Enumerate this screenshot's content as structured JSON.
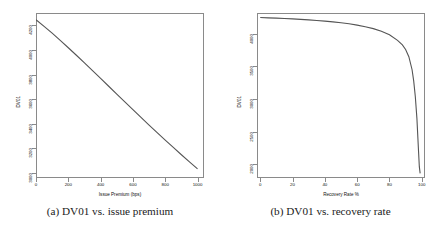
{
  "figure": {
    "panels": [
      {
        "id": "panel-a",
        "caption": "(a) DV01 vs. issue premium",
        "xlabel": "Issue Premium (bps)",
        "ylabel": "DV01"
      },
      {
        "id": "panel-b",
        "caption": "(b) DV01 vs. recovery rate",
        "xlabel": "Recovery Rate %",
        "ylabel": "DV01"
      }
    ]
  },
  "chart_data": [
    {
      "type": "line",
      "title": "",
      "caption": "(a) DV01 vs. issue premium",
      "xlabel": "Issue Premium (bps)",
      "ylabel": "DV01",
      "xlim": [
        0,
        1040
      ],
      "ylim": [
        2960,
        4300
      ],
      "xticks": [
        0,
        200,
        400,
        600,
        800,
        1000
      ],
      "xtick_labels": [
        "0",
        "200",
        "400",
        "600",
        "800",
        "1000"
      ],
      "yticks": [
        3000,
        3200,
        3400,
        3600,
        3800,
        4000,
        4200
      ],
      "ytick_labels": [
        "3000",
        "3200",
        "3400",
        "3600",
        "3800",
        "4000",
        "4200"
      ],
      "grid": false,
      "legend": null,
      "line_color": "#555555",
      "x": [
        0,
        50,
        100,
        150,
        200,
        250,
        300,
        350,
        400,
        450,
        500,
        550,
        600,
        650,
        700,
        750,
        800,
        850,
        900,
        950,
        1000
      ],
      "y": [
        4245,
        4192,
        4136,
        4078,
        4018,
        3957,
        3895,
        3832,
        3769,
        3705,
        3641,
        3578,
        3515,
        3452,
        3390,
        3329,
        3268,
        3208,
        3149,
        3091,
        3034
      ]
    },
    {
      "type": "line",
      "title": "",
      "caption": "(b) DV01 vs. recovery rate",
      "xlabel": "Recovery Rate %",
      "ylabel": "DV01",
      "xlim": [
        -2,
        102
      ],
      "ylim": [
        1790,
        4320
      ],
      "xticks": [
        0,
        20,
        40,
        60,
        80,
        100
      ],
      "xtick_labels": [
        "0",
        "20",
        "40",
        "60",
        "80",
        "100"
      ],
      "yticks": [
        2000,
        2500,
        3000,
        3500,
        4000
      ],
      "ytick_labels": [
        "2000",
        "2500",
        "3000",
        "3500",
        "4000"
      ],
      "grid": false,
      "legend": null,
      "line_color": "#555555",
      "x": [
        0,
        5,
        10,
        15,
        20,
        25,
        30,
        35,
        40,
        45,
        50,
        55,
        60,
        65,
        70,
        75,
        80,
        85,
        88,
        90,
        92,
        94,
        95,
        96,
        97,
        98,
        98.5,
        99
      ],
      "y": [
        4250,
        4246,
        4241,
        4236,
        4230,
        4223,
        4215,
        4206,
        4196,
        4184,
        4170,
        4154,
        4134,
        4110,
        4080,
        4040,
        3985,
        3900,
        3830,
        3760,
        3650,
        3450,
        3280,
        3040,
        2700,
        2200,
        1960,
        1860
      ]
    }
  ]
}
